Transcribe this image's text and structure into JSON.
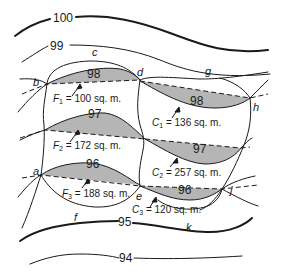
{
  "contours": [
    {
      "id": "c100",
      "label": "100",
      "weight": "heavy"
    },
    {
      "id": "c99",
      "label": "99",
      "weight": "light"
    },
    {
      "id": "c98",
      "label": "98",
      "weight": "light"
    },
    {
      "id": "c97",
      "label": "97",
      "weight": "light"
    },
    {
      "id": "c96",
      "label": "96",
      "weight": "light"
    },
    {
      "id": "c95",
      "label": "95",
      "weight": "heavy"
    },
    {
      "id": "c94",
      "label": "94",
      "weight": "light"
    }
  ],
  "contour_labels": {
    "c100": "100",
    "c99": "99",
    "c98_left": "98",
    "c98_right": "98",
    "c97_left": "97",
    "c97_right": "97",
    "c96_left": "96",
    "c96_right": "96",
    "c95": "95",
    "c94": "94"
  },
  "points": {
    "a": "a",
    "b": "b",
    "c": "c",
    "d": "d",
    "e": "e",
    "f": "f",
    "g": "g",
    "h": "h",
    "j": "j",
    "k": "k"
  },
  "areas": {
    "F1": {
      "sym": "F",
      "sub": "1",
      "text": " = 100 sq. m.",
      "value": 100,
      "unit": "sq. m.",
      "type": "fill"
    },
    "F2": {
      "sym": "F",
      "sub": "2",
      "text": " = 172 sq. m.",
      "value": 172,
      "unit": "sq. m.",
      "type": "fill"
    },
    "F3": {
      "sym": "F",
      "sub": "3",
      "text": " = 188 sq. m.",
      "value": 188,
      "unit": "sq. m.",
      "type": "fill"
    },
    "C1": {
      "sym": "C",
      "sub": "1",
      "text": " = 136 sq. m.",
      "value": 136,
      "unit": "sq. m.",
      "type": "cut"
    },
    "C2": {
      "sym": "C",
      "sub": "2",
      "text": " = 257 sq. m.",
      "value": 257,
      "unit": "sq. m.",
      "type": "cut"
    },
    "C3": {
      "sym": "C",
      "sub": "3",
      "text": " = 120 sq. m.",
      "value": 120,
      "unit": "sq. m.",
      "type": "cut"
    }
  },
  "colors": {
    "line": "#1a1a1a",
    "shade": "#b5b5b5",
    "background": "#ffffff"
  }
}
